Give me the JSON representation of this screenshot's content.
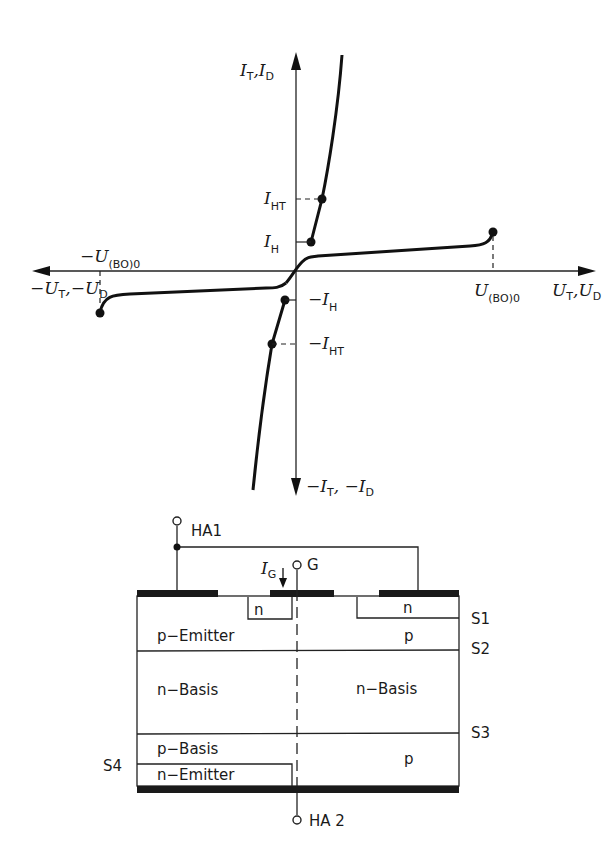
{
  "characteristic": {
    "y_axis_pos": {
      "symbol": "I",
      "sub1": "T",
      "sep": ",",
      "symbol2": "I",
      "sub2": "D"
    },
    "y_axis_neg": {
      "prefix": "−",
      "symbol": "I",
      "sub1": "T",
      "sep": ", −",
      "symbol2": "I",
      "sub2": "D"
    },
    "x_axis_pos": {
      "symbol": "U",
      "sub1": "T",
      "sep": ",",
      "symbol2": "U",
      "sub2": "D"
    },
    "x_axis_neg": {
      "prefix": "−",
      "symbol": "U",
      "sub1": "T",
      "sep": ",−",
      "symbol2": "U",
      "sub2": "D"
    },
    "breakover_pos": {
      "symbol": "U",
      "sub": "(BO)0"
    },
    "breakover_neg": {
      "prefix": "−",
      "symbol": "U",
      "sub": "(BO)0"
    },
    "holding_pos": {
      "symbol": "I",
      "sub": "H"
    },
    "holding_trigger_pos": {
      "symbol": "I",
      "sub": "HT"
    },
    "holding_neg": {
      "prefix": "−",
      "symbol": "I",
      "sub": "H"
    },
    "holding_trigger_neg": {
      "prefix": "−",
      "symbol": "I",
      "sub": "HT"
    }
  },
  "structure": {
    "terminal_anode1": "HA1",
    "terminal_anode2": "HA 2",
    "terminal_gate": "G",
    "gate_current": {
      "symbol": "I",
      "sub": "G"
    },
    "regions": {
      "n_left": "n",
      "n_right": "n",
      "p_emitter": "p−Emitter",
      "p_right_top": "p",
      "n_basis_left": "n−Basis",
      "n_basis_right": "n−Basis",
      "p_basis": "p−Basis",
      "p_right_bottom": "p",
      "n_emitter": "n−Emitter"
    },
    "junctions": {
      "s1": "S1",
      "s2": "S2",
      "s3": "S3",
      "s4": "S4"
    }
  }
}
